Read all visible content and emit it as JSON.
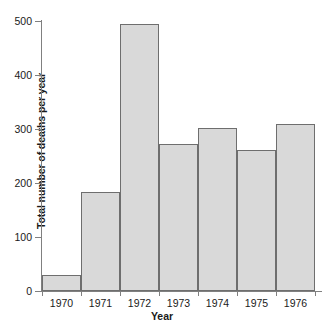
{
  "chart_data": {
    "type": "bar",
    "title": "",
    "xlabel": "Year",
    "ylabel": "Total number of deaths per year",
    "categories": [
      "1970",
      "1971",
      "1972",
      "1973",
      "1974",
      "1975",
      "1976"
    ],
    "values": [
      29,
      183,
      494,
      272,
      302,
      262,
      309
    ],
    "ylim": [
      0,
      500
    ],
    "yticks": [
      0,
      100,
      200,
      300,
      400,
      500
    ],
    "ytick_labels": [
      "0",
      "100",
      "200",
      "300",
      "400",
      "500"
    ],
    "grid": false,
    "legend": null,
    "bar_fill_color": "#d9d9d9",
    "bar_edge_color": "#6e6e6e",
    "axis_color": "#808080",
    "text_color": "#1a1a1a",
    "background_color": "#ffffff"
  }
}
